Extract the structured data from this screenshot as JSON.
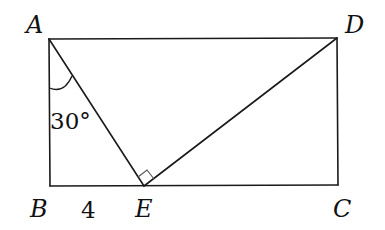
{
  "figure": {
    "type": "geometry",
    "vertices": {
      "A": {
        "label": "A",
        "x": 49,
        "y": 39
      },
      "B": {
        "label": "B",
        "x": 50,
        "y": 186
      },
      "C": {
        "label": "C",
        "x": 338,
        "y": 185
      },
      "D": {
        "label": "D",
        "x": 337,
        "y": 38
      },
      "E": {
        "label": "E",
        "x": 144,
        "y": 186
      }
    },
    "segments": [
      "AB",
      "BC",
      "CD",
      "DA",
      "AE",
      "DE"
    ],
    "annotations": {
      "angle_BAE": "30°",
      "length_BE": "4",
      "right_angle_at": "E"
    }
  }
}
